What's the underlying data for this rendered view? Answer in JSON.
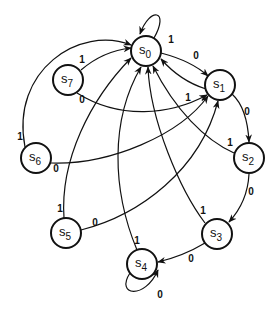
{
  "diagram": {
    "type": "state-diagram",
    "nodes": [
      {
        "id": "S0",
        "base": "S",
        "sub": "0"
      },
      {
        "id": "S1",
        "base": "S",
        "sub": "1"
      },
      {
        "id": "S2",
        "base": "S",
        "sub": "2"
      },
      {
        "id": "S3",
        "base": "S",
        "sub": "3"
      },
      {
        "id": "S4",
        "base": "S",
        "sub": "4"
      },
      {
        "id": "S5",
        "base": "S",
        "sub": "5"
      },
      {
        "id": "S6",
        "base": "S",
        "sub": "6"
      },
      {
        "id": "S7",
        "base": "S",
        "sub": "7"
      }
    ],
    "edges": [
      {
        "from": "S0",
        "to": "S0",
        "label": "1"
      },
      {
        "from": "S0",
        "to": "S1",
        "label": "0"
      },
      {
        "from": "S1",
        "to": "S0",
        "label": "1"
      },
      {
        "from": "S1",
        "to": "S2",
        "label": "0"
      },
      {
        "from": "S2",
        "to": "S0",
        "label": "1"
      },
      {
        "from": "S2",
        "to": "S3",
        "label": "0"
      },
      {
        "from": "S3",
        "to": "S0",
        "label": "1"
      },
      {
        "from": "S3",
        "to": "S4",
        "label": "0"
      },
      {
        "from": "S4",
        "to": "S0",
        "label": "1"
      },
      {
        "from": "S4",
        "to": "S4",
        "label": "0"
      },
      {
        "from": "S5",
        "to": "S0",
        "label": "1"
      },
      {
        "from": "S5",
        "to": "S1",
        "label": "0"
      },
      {
        "from": "S6",
        "to": "S0",
        "label": "1"
      },
      {
        "from": "S6",
        "to": "S1",
        "label": "0"
      },
      {
        "from": "S7",
        "to": "S0",
        "label": "1"
      },
      {
        "from": "S7",
        "to": "S1",
        "label": "0"
      }
    ]
  }
}
